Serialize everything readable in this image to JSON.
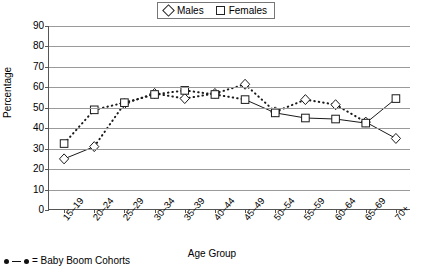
{
  "legend": {
    "entries": [
      {
        "label": "Males",
        "marker": "diamond-marker-icon"
      },
      {
        "label": "Females",
        "marker": "square-marker-icon"
      }
    ]
  },
  "axes": {
    "ylabel": "Percentage",
    "xlabel": "Age Group",
    "yticks": [
      "90",
      "80",
      "70",
      "60",
      "50",
      "40",
      "30",
      "20",
      "10",
      "0"
    ],
    "xticks": [
      "15–19",
      "20–24",
      "25–29",
      "30–34",
      "35–39",
      "40–44",
      "45–49",
      "50–54",
      "55–59",
      "60–64",
      "65–69",
      "70+"
    ]
  },
  "footnote": {
    "text": "= Baby Boom Cohorts",
    "marker": "dot-line-dot-icon"
  },
  "chart_data": {
    "type": "line",
    "title": "",
    "xlabel": "Age Group",
    "ylabel": "Percentage",
    "ylim": [
      0,
      90
    ],
    "ytick_step": 10,
    "grid": true,
    "legend_position": "top-center",
    "categories": [
      "15–19",
      "20–24",
      "25–29",
      "30–34",
      "35–39",
      "40–44",
      "45–49",
      "50–54",
      "55–59",
      "60–64",
      "65–69",
      "70+"
    ],
    "series": [
      {
        "name": "Males",
        "marker": "diamond",
        "values": [
          25.0,
          31.0,
          52.0,
          57.0,
          54.5,
          57.0,
          61.5,
          48.0,
          54.0,
          51.5,
          43.0,
          35.0
        ],
        "baby_boom_segment": [
          1,
          10
        ]
      },
      {
        "name": "Females",
        "marker": "square",
        "values": [
          32.5,
          49.0,
          52.5,
          56.5,
          58.5,
          56.5,
          54.0,
          47.5,
          45.0,
          44.5,
          42.5,
          54.5
        ],
        "baby_boom_segment": [
          0,
          6
        ]
      }
    ],
    "annotations": [
      "= Baby Boom Cohorts"
    ]
  }
}
